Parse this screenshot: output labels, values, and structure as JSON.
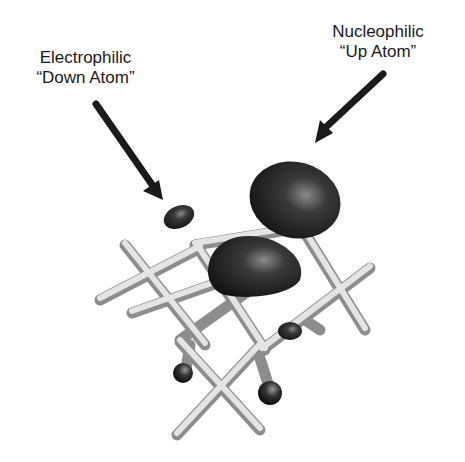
{
  "labels": {
    "electrophilic": {
      "line1": "Electrophilic",
      "line2": "“Down Atom”"
    },
    "nucleophilic": {
      "line1": "Nucleophilic",
      "line2": "“Up Atom”"
    }
  },
  "colors": {
    "background": "#ffffff",
    "text": "#1a1a1a",
    "arrow": "#1a1a1a",
    "lobe": "#2a2a2a",
    "bond": "#cfcfcf"
  }
}
